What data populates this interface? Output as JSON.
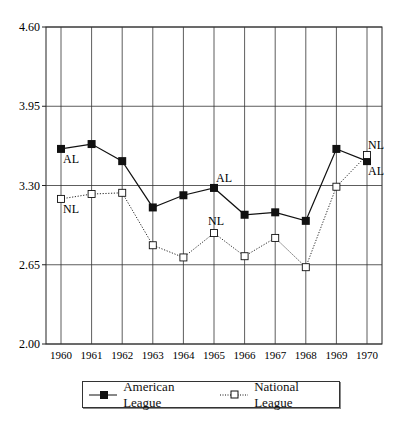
{
  "chart_data": {
    "type": "line",
    "title": "",
    "xlabel": "",
    "ylabel": "",
    "x": [
      "1960",
      "1961",
      "1962",
      "1963",
      "1964",
      "1965",
      "1966",
      "1967",
      "1968",
      "1969",
      "1970"
    ],
    "yticks": [
      "2.00",
      "2.65",
      "3.30",
      "3.95",
      "4.60"
    ],
    "ylim": [
      2.0,
      4.6
    ],
    "grid": true,
    "legend_position": "bottom",
    "series": [
      {
        "name": "American League",
        "marker": "filled-square",
        "line": "solid",
        "values": [
          3.6,
          3.64,
          3.5,
          3.12,
          3.22,
          3.28,
          3.06,
          3.08,
          3.01,
          3.6,
          3.5
        ]
      },
      {
        "name": "National League",
        "marker": "open-square",
        "line": "dotted",
        "values": [
          3.19,
          3.23,
          3.24,
          2.81,
          2.71,
          2.91,
          2.72,
          2.87,
          2.63,
          3.29,
          3.55
        ]
      }
    ],
    "annotations": [
      {
        "text": "AL",
        "x": "1960",
        "series": "American League"
      },
      {
        "text": "NL",
        "x": "1960",
        "series": "National League"
      },
      {
        "text": "AL",
        "x": "1965",
        "series": "American League"
      },
      {
        "text": "NL",
        "x": "1965",
        "series": "National League"
      },
      {
        "text": "NL",
        "x": "1970",
        "series": "National League"
      },
      {
        "text": "AL",
        "x": "1970",
        "series": "American League"
      }
    ]
  },
  "legend": {
    "al_label": "American League",
    "nl_label": "National League"
  }
}
